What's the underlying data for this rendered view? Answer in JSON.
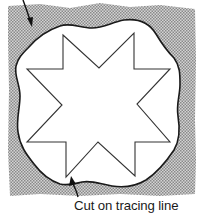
{
  "diagram": {
    "labels": {
      "bottom_caption": "Cut on tracing line",
      "top_caption_partial": ""
    },
    "shapes": {
      "background_paper": {
        "fill_pattern": "halftone-gray",
        "color": "#b8b8b8"
      },
      "tracing_line": {
        "style": "wavy-outline",
        "stroke": "#1a1a1a",
        "fill": "#ffffff"
      },
      "star": {
        "type": "eight-point-star",
        "stroke": "#333333",
        "fill": "#ffffff"
      }
    },
    "arrows": [
      {
        "name": "top-pointer",
        "direction": "down"
      },
      {
        "name": "bottom-pointer",
        "direction": "up",
        "target": "tracing_line"
      }
    ]
  }
}
